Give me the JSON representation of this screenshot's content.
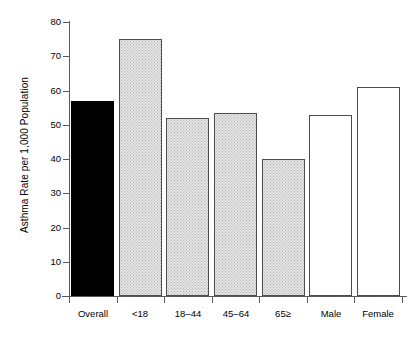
{
  "chart_data": {
    "type": "bar",
    "title": "",
    "subtitle": "",
    "xlabel": "",
    "ylabel": "Asthma Rate per 1,000 Population",
    "categories": [
      "Overall",
      "<18",
      "18–44",
      "45–64",
      "65≥",
      "Male",
      "Female"
    ],
    "values": [
      57,
      75,
      52,
      53.5,
      40,
      52.8,
      61
    ],
    "ylim": [
      0,
      80
    ],
    "yticks": [
      0,
      10,
      20,
      30,
      40,
      50,
      60,
      70,
      80
    ],
    "ytick_labels": [
      "0",
      "10",
      "20",
      "30",
      "40",
      "50",
      "60",
      "70",
      "80"
    ],
    "grid": false,
    "legend": null,
    "bar_styles": [
      "black",
      "stipple",
      "stipple",
      "stipple",
      "stipple",
      "white",
      "white"
    ],
    "colors": {
      "black_bar": "#000000",
      "stipple_bar_fill": "#e4e4e4",
      "stipple_bar_edge": "#4d4d4d",
      "white_bar_fill": "#ffffff",
      "white_bar_edge": "#4d4d4d",
      "axis": "#5a5a5a",
      "text": "#000000",
      "background": "#ffffff"
    }
  }
}
